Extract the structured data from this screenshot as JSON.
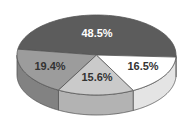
{
  "chart_data": {
    "type": "pie",
    "style": "3d",
    "title": "",
    "slices": [
      {
        "label": "48.5%",
        "value": 48.5,
        "top_color": "#5c5c5c",
        "wall_color": "#4a4a4a",
        "text_color": "#ffffff"
      },
      {
        "label": "16.5%",
        "value": 16.5,
        "top_color": "#ffffff",
        "wall_color": "#e4e4e4",
        "text_color": "#333333"
      },
      {
        "label": "15.6%",
        "value": 15.6,
        "top_color": "#cacaca",
        "wall_color": "#b3b3b3",
        "text_color": "#333333"
      },
      {
        "label": "19.4%",
        "value": 19.4,
        "top_color": "#9c9c9c",
        "wall_color": "#828282",
        "text_color": "#333333"
      }
    ],
    "legend": null,
    "outline_color": "#555555"
  }
}
